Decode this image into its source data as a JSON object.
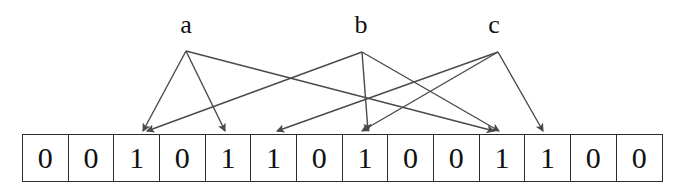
{
  "figure": {
    "type": "bloom-filter-insertion-diagram",
    "background_color": "#ffffff",
    "line_color": "#4a4a4a",
    "text_color": "#111111",
    "border_color": "#2b2b2b",
    "width": 679,
    "height": 194
  },
  "sources": [
    {
      "label": "a",
      "x": 186,
      "y": 25,
      "apex_x": 186,
      "apex_y": 51
    },
    {
      "label": "b",
      "x": 361,
      "y": 25,
      "apex_x": 362,
      "apex_y": 52
    },
    {
      "label": "c",
      "x": 494,
      "y": 25,
      "apex_x": 498,
      "apex_y": 52
    }
  ],
  "bit_array": {
    "left": 22,
    "top": 134,
    "cell_width": 45.8,
    "cell_height": 48,
    "count": 14,
    "bits": [
      "0",
      "0",
      "1",
      "0",
      "1",
      "1",
      "0",
      "1",
      "0",
      "0",
      "1",
      "1",
      "0",
      "0"
    ]
  },
  "arrows": [
    {
      "from": "a",
      "to_cell": 2,
      "x1": 186,
      "y1": 51,
      "x2": 143,
      "y2": 131
    },
    {
      "from": "a",
      "to_cell": 4,
      "x1": 186,
      "y1": 51,
      "x2": 225,
      "y2": 131
    },
    {
      "from": "a",
      "to_cell": 10,
      "x1": 186,
      "y1": 51,
      "x2": 494,
      "y2": 131
    },
    {
      "from": "b",
      "to_cell": 2,
      "x1": 362,
      "y1": 52,
      "x2": 147,
      "y2": 131
    },
    {
      "from": "b",
      "to_cell": 7,
      "x1": 362,
      "y1": 52,
      "x2": 368,
      "y2": 131
    },
    {
      "from": "b",
      "to_cell": 10,
      "x1": 362,
      "y1": 52,
      "x2": 499,
      "y2": 131
    },
    {
      "from": "c",
      "to_cell": 5,
      "x1": 498,
      "y1": 52,
      "x2": 277,
      "y2": 131
    },
    {
      "from": "c",
      "to_cell": 7,
      "x1": 498,
      "y1": 52,
      "x2": 362,
      "y2": 131
    },
    {
      "from": "c",
      "to_cell": 11,
      "x1": 498,
      "y1": 52,
      "x2": 543,
      "y2": 131
    }
  ]
}
